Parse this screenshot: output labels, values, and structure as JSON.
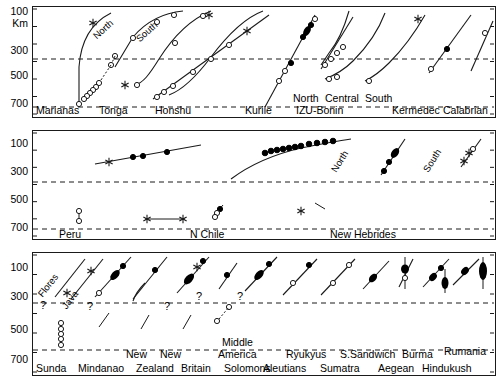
{
  "figure": {
    "y_axis_unit": "Km",
    "y_ticks": [
      "100",
      "300",
      "500",
      "700"
    ],
    "y_tick_values": [
      100,
      300,
      500,
      700
    ],
    "y_range": [
      30,
      720
    ],
    "reference_depths": [
      350,
      700
    ]
  },
  "chart_data": {
    "type": "scatter",
    "title": "",
    "xlabel": "",
    "ylabel": "Km",
    "ylim": [
      30,
      720
    ],
    "y_inverted": true,
    "grid": false,
    "legend": null,
    "dashed_reference_lines": [
      350,
      700
    ],
    "symbols": {
      "open_circle": "open circle datum",
      "filled_circle": "filled circle datum",
      "star": "star datum",
      "curve": "slab trace",
      "question": "?"
    },
    "panels": [
      {
        "index": 1,
        "regions": [
          {
            "name": "Marianas",
            "label": "Marianas",
            "sub_labels": [],
            "points": [
              {
                "depth": 130,
                "sym": "star"
              },
              {
                "depth": 690,
                "sym": "open_circle"
              }
            ]
          },
          {
            "name": "Tonga",
            "label": "Tonga",
            "sub_labels": [
              "North",
              "South"
            ],
            "points": [
              {
                "depth": 90,
                "sym": "open_circle"
              },
              {
                "depth": 190,
                "sym": "open_circle"
              },
              {
                "depth": 340,
                "sym": "open_circle"
              },
              {
                "depth": 420,
                "sym": "open_circle"
              },
              {
                "depth": 530,
                "sym": "open_circle"
              },
              {
                "depth": 560,
                "sym": "open_circle"
              },
              {
                "depth": 580,
                "sym": "open_circle"
              },
              {
                "depth": 600,
                "sym": "open_circle"
              },
              {
                "depth": 630,
                "sym": "open_circle"
              },
              {
                "depth": 660,
                "sym": "open_circle"
              },
              {
                "depth": 550,
                "sym": "star"
              },
              {
                "depth": 545,
                "sym": "open_circle"
              },
              {
                "depth": 200,
                "sym": "open_circle"
              },
              {
                "depth": 120,
                "sym": "star"
              }
            ]
          },
          {
            "name": "Honshu",
            "label": "Honshu",
            "sub_labels": [],
            "points": [
              {
                "depth": 610,
                "sym": "open_circle"
              },
              {
                "depth": 590,
                "sym": "open_circle"
              },
              {
                "depth": 555,
                "sym": "open_circle"
              },
              {
                "depth": 450,
                "sym": "open_circle"
              },
              {
                "depth": 345,
                "sym": "open_circle"
              },
              {
                "depth": 235,
                "sym": "open_circle"
              },
              {
                "depth": 165,
                "sym": "star"
              }
            ]
          },
          {
            "name": "Kurile",
            "label": "Kurile",
            "sub_labels": [],
            "points": [
              {
                "depth": 400,
                "sym": "open_circle"
              },
              {
                "depth": 385,
                "sym": "open_circle"
              },
              {
                "depth": 350,
                "sym": "filled_circle"
              },
              {
                "depth": 120,
                "sym": "filled_circle"
              },
              {
                "depth": 105,
                "sym": "filled_circle"
              },
              {
                "depth": 100,
                "sym": "filled_circle"
              },
              {
                "depth": 95,
                "sym": "filled_circle"
              },
              {
                "depth": 85,
                "sym": "open_circle"
              }
            ]
          },
          {
            "name": "IZU-Bonin",
            "label": "IZU-Bonin",
            "sub_labels": [
              "North",
              "Central",
              "South"
            ],
            "points": [
              {
                "depth": 430,
                "sym": "open_circle"
              },
              {
                "depth": 410,
                "sym": "open_circle"
              },
              {
                "depth": 395,
                "sym": "open_circle"
              },
              {
                "depth": 275,
                "sym": "open_circle"
              },
              {
                "depth": 255,
                "sym": "open_circle"
              },
              {
                "depth": 425,
                "sym": "open_circle"
              },
              {
                "depth": 440,
                "sym": "open_circle"
              },
              {
                "depth": 470,
                "sym": "open_circle"
              },
              {
                "depth": 100,
                "sym": "star"
              }
            ]
          },
          {
            "name": "Kermedec",
            "label": "Kermedec",
            "sub_labels": [],
            "points": [
              {
                "depth": 350,
                "sym": "open_circle"
              },
              {
                "depth": 170,
                "sym": "filled_circle"
              }
            ]
          },
          {
            "name": "Calabrian",
            "label": "Calabrian",
            "sub_labels": [],
            "points": [
              {
                "depth": 160,
                "sym": "open_circle"
              }
            ]
          }
        ]
      },
      {
        "index": 2,
        "regions": [
          {
            "name": "Peru",
            "label": "Peru",
            "sub_labels": [],
            "points": [
              {
                "depth": 155,
                "sym": "star"
              },
              {
                "depth": 110,
                "sym": "filled_circle"
              },
              {
                "depth": 105,
                "sym": "filled_circle"
              },
              {
                "depth": 85,
                "sym": "filled_circle"
              },
              {
                "depth": 560,
                "sym": "open_circle"
              },
              {
                "depth": 640,
                "sym": "open_circle"
              }
            ]
          },
          {
            "name": "N Chile",
            "label": "N Chile",
            "sub_labels": [],
            "points": [
              {
                "depth": 120,
                "sym": "filled_circle"
              },
              {
                "depth": 110,
                "sym": "filled_circle"
              },
              {
                "depth": 100,
                "sym": "filled_circle"
              },
              {
                "depth": 95,
                "sym": "filled_circle"
              },
              {
                "depth": 90,
                "sym": "filled_circle"
              },
              {
                "depth": 85,
                "sym": "filled_circle"
              },
              {
                "depth": 80,
                "sym": "filled_circle"
              },
              {
                "depth": 600,
                "sym": "open_circle"
              },
              {
                "depth": 575,
                "sym": "filled_circle"
              }
            ]
          },
          {
            "name": "New Hebrides",
            "label": "New Hebrides",
            "sub_labels": [
              "North",
              "South"
            ],
            "points": [
              {
                "depth": 95,
                "sym": "filled_circle"
              },
              {
                "depth": 130,
                "sym": "filled_circle"
              },
              {
                "depth": 155,
                "sym": "filled_circle"
              },
              {
                "depth": 95,
                "sym": "open_circle"
              },
              {
                "depth": 120,
                "sym": "star"
              },
              {
                "depth": 145,
                "sym": "star"
              },
              {
                "depth": 600,
                "sym": "star"
              },
              {
                "depth": 605,
                "sym": "star"
              },
              {
                "depth": 555,
                "sym": "star"
              }
            ]
          }
        ]
      },
      {
        "index": 3,
        "regions": [
          {
            "name": "Sunda",
            "label": "Sunda",
            "sub_labels": [
              "Flores",
              "Java"
            ],
            "points": [
              {
                "depth": 120,
                "sym": "star"
              },
              {
                "depth": 215,
                "sym": "star"
              },
              {
                "depth": 510,
                "sym": "open_circle"
              },
              {
                "depth": 550,
                "sym": "open_circle"
              },
              {
                "depth": 590,
                "sym": "open_circle"
              },
              {
                "depth": 625,
                "sym": "open_circle"
              },
              {
                "depth": 665,
                "sym": "open_circle"
              }
            ],
            "annotations": [
              "?"
            ]
          },
          {
            "name": "Mindanao",
            "label": "Mindanao",
            "sub_labels": [],
            "points": [
              {
                "depth": 80,
                "sym": "filled_circle"
              },
              {
                "depth": 130,
                "sym": "filled_circle"
              },
              {
                "depth": 160,
                "sym": "filled_circle"
              },
              {
                "depth": 265,
                "sym": "open_circle"
              }
            ],
            "annotations": [
              "?"
            ]
          },
          {
            "name": "New Zealand",
            "label": "New Zealand",
            "sub_labels": [],
            "points": [
              {
                "depth": 150,
                "sym": "filled_circle"
              }
            ]
          },
          {
            "name": "New Britain",
            "label": "New Britain",
            "sub_labels": [],
            "points": [
              {
                "depth": 75,
                "sym": "filled_circle"
              },
              {
                "depth": 105,
                "sym": "star"
              },
              {
                "depth": 140,
                "sym": "filled_circle"
              },
              {
                "depth": 170,
                "sym": "filled_circle"
              },
              {
                "depth": 200,
                "sym": "filled_circle"
              }
            ],
            "annotations": [
              "?"
            ]
          },
          {
            "name": "Solomons",
            "label": "Solomons",
            "sub_labels": [],
            "points": [
              {
                "depth": 110,
                "sym": "filled_circle"
              },
              {
                "depth": 390,
                "sym": "open_circle"
              },
              {
                "depth": 500,
                "sym": "open_circle"
              }
            ],
            "annotations": [
              "?"
            ]
          },
          {
            "name": "Middle America",
            "label": "Middle America",
            "sub_labels": [],
            "points": [
              {
                "depth": 110,
                "sym": "filled_circle"
              },
              {
                "depth": 145,
                "sym": "filled_circle"
              },
              {
                "depth": 170,
                "sym": "filled_circle"
              }
            ]
          },
          {
            "name": "Aleutians",
            "label": "Aleutians",
            "sub_labels": [],
            "points": [
              {
                "depth": 90,
                "sym": "filled_circle"
              },
              {
                "depth": 175,
                "sym": "open_circle"
              }
            ]
          },
          {
            "name": "Ryukyus",
            "label": "Ryukyus",
            "sub_labels": [],
            "points": [
              {
                "depth": 75,
                "sym": "filled_circle"
              },
              {
                "depth": 150,
                "sym": "open_circle"
              }
            ]
          },
          {
            "name": "Sumatra",
            "label": "Sumatra",
            "sub_labels": [],
            "points": [
              {
                "depth": 190,
                "sym": "open_circle"
              }
            ]
          },
          {
            "name": "S.Sandwich",
            "label": "S.Sandwich",
            "sub_labels": [],
            "points": [
              {
                "depth": 165,
                "sym": "filled_circle"
              }
            ]
          },
          {
            "name": "Aegean",
            "label": "Aegean",
            "sub_labels": [],
            "points": [
              {
                "depth": 105,
                "sym": "filled_circle"
              },
              {
                "depth": 140,
                "sym": "open_circle"
              }
            ]
          },
          {
            "name": "Burma",
            "label": "Burma",
            "sub_labels": [],
            "points": [
              {
                "depth": 110,
                "sym": "filled_circle"
              },
              {
                "depth": 160,
                "sym": "filled_circle"
              }
            ]
          },
          {
            "name": "Hindukush",
            "label": "Hindukush",
            "sub_labels": [],
            "points": [
              {
                "depth": 115,
                "sym": "filled_circle"
              }
            ]
          },
          {
            "name": "Rumania",
            "label": "Rumania",
            "sub_labels": [],
            "points": [
              {
                "depth": 195,
                "sym": "filled_circle"
              },
              {
                "depth": 130,
                "sym": "filled_circle"
              }
            ]
          }
        ]
      }
    ]
  },
  "panel1": {
    "y_labels": [
      "100",
      "300",
      "500",
      "700"
    ],
    "unit": "Km",
    "zone_labels": [
      "Marianas",
      "Tonga",
      "Honshu",
      "Kurile",
      "IZU-Bonin",
      "Kermedec",
      "Calabrian"
    ],
    "inline_labels": [
      "North",
      "South",
      "North",
      "Central",
      "South"
    ]
  },
  "panel2": {
    "y_labels": [
      "100",
      "300",
      "500",
      "700"
    ],
    "zone_labels": [
      "Peru",
      "N Chile",
      "New Hebrides"
    ],
    "inline_labels": [
      "North",
      "South"
    ]
  },
  "panel3": {
    "y_labels": [
      "100",
      "300",
      "500",
      "700"
    ],
    "zone_labels_lower": [
      "Sunda",
      "Mindanao",
      "Zealand",
      "Britain",
      "Solomons",
      "Aleutians",
      "Sumatra",
      "Aegean",
      "Hindukush"
    ],
    "zone_labels_upper": [
      "New",
      "New",
      "Middle",
      "America",
      "Ryukyus",
      "S.Sandwich",
      "Burma",
      "Rumania"
    ],
    "inline_labels": [
      "Flores",
      "Java"
    ],
    "question_marks": [
      "?",
      "?",
      "?",
      "?",
      "?"
    ]
  },
  "labels": {
    "marianas": "Marianas",
    "tonga": "Tonga",
    "honshu": "Honshu",
    "kurile": "Kurile",
    "izu_bonin": "IZU-Bonin",
    "kermedec": "Kermedec",
    "calabrian": "Calabrian",
    "north": "North",
    "south": "South",
    "central": "Central",
    "peru": "Peru",
    "n_chile": "N Chile",
    "new_hebrides": "New Hebrides",
    "sunda": "Sunda",
    "mindanao": "Mindanao",
    "new": "New",
    "zealand": "Zealand",
    "britain": "Britain",
    "solomons": "Solomons",
    "middle": "Middle",
    "america": "America",
    "aleutians": "Aleutians",
    "ryukyus": "Ryukyus",
    "sumatra": "Sumatra",
    "s_sandwich": "S.Sandwich",
    "aegean": "Aegean",
    "burma": "Burma",
    "hindukush": "Hindukush",
    "rumania": "Rumania",
    "flores": "Flores",
    "java": "Java",
    "q": "?",
    "km": "Km",
    "t100": "100",
    "t300": "300",
    "t500": "500",
    "t700": "700"
  },
  "colors": {
    "stroke": "#1a1a1a",
    "background": "#ffffff",
    "fill": "#000000"
  }
}
